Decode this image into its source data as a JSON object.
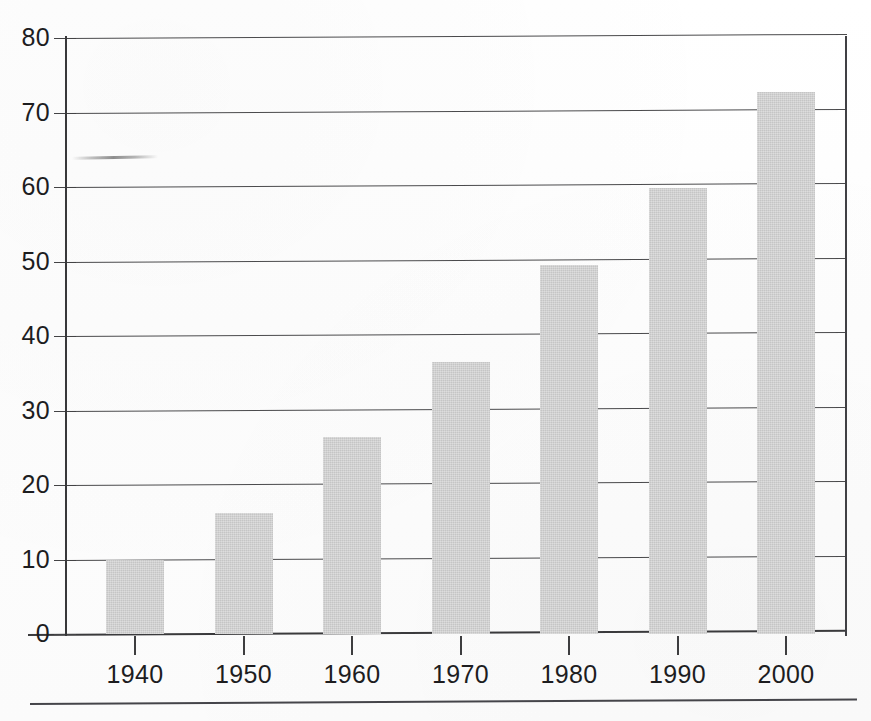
{
  "page": {
    "background_color": "#fdfdfd",
    "separator_rule": "page-separator"
  },
  "artifacts": {
    "smudge_label": "faint pencil smudge near 64 on y-axis"
  },
  "chart_data": {
    "type": "bar",
    "title": "",
    "subtitle": "",
    "xlabel": "",
    "ylabel": "",
    "categories": [
      "1940",
      "1950",
      "1960",
      "1970",
      "1980",
      "1990",
      "2000"
    ],
    "values": [
      10.0,
      16.2,
      26.5,
      36.5,
      49.5,
      59.8,
      72.7
    ],
    "series": [
      {
        "name": "",
        "values": [
          10.0,
          16.2,
          26.5,
          36.5,
          49.5,
          59.8,
          72.7
        ]
      }
    ],
    "ylim": [
      0,
      80
    ],
    "ytick_values": [
      0,
      10,
      20,
      30,
      40,
      50,
      60,
      70,
      80
    ],
    "ytick_labels": [
      "0",
      "10",
      "20",
      "30",
      "40",
      "50",
      "60",
      "70",
      "80"
    ],
    "xtick_labels": [
      "1940",
      "1950",
      "1960",
      "1970",
      "1980",
      "1990",
      "2000"
    ],
    "grid": true,
    "grid_axis": "y",
    "legend": false,
    "legend_position": "none",
    "bar_color": "#cbcbcb",
    "axis_color": "#3a3a3c",
    "text_color": "#1d1d1f",
    "annotations": []
  }
}
